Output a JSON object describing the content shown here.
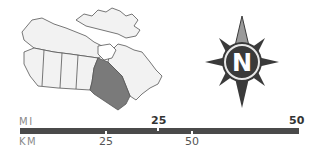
{
  "map": {
    "region": "Canada",
    "highlighted_province": "Ontario",
    "highlight_color": "#7a7a7a",
    "base_color": "#f0f0f0",
    "outline_color": "#555555"
  },
  "compass": {
    "letter": "N",
    "ring_color": "#3a3a3a"
  },
  "scale_bar": {
    "miles_label": "MI",
    "km_label": "KM",
    "miles_ticks": [
      "25",
      "50"
    ],
    "km_ticks": [
      "25",
      "50"
    ],
    "bar_color": "#4a4a4a"
  }
}
